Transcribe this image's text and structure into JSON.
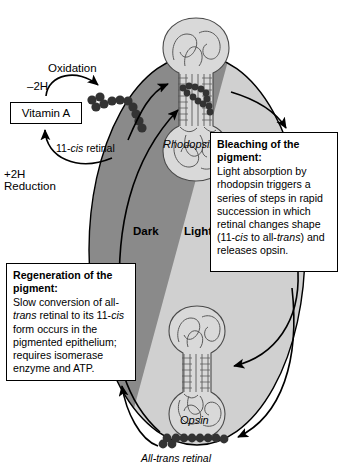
{
  "diagram": {
    "colors": {
      "dark_zone": "#8a8a8a",
      "light_zone": "#d0d0d0",
      "protein_fill": "#d9d9d9",
      "retinal": "#3a3a3a",
      "outline": "#000000",
      "callout_background": "#ffffff"
    }
  },
  "labels": {
    "oxidation": "Oxidation",
    "minus_2h": "–2H",
    "plus_2h": "+2H",
    "reduction": "Reduction",
    "vitamin_a": "Vitamin A",
    "eleven_cis_retinal_plain": "11-",
    "eleven_cis_retinal_italic": "cis",
    "eleven_cis_retinal_tail": " retinal",
    "rhodopsin": "Rhodopsin",
    "opsin": "Opsin",
    "all_trans_retinal_italic": "All-trans",
    "all_trans_retinal_tail": " retinal",
    "dark": "Dark",
    "light": "Light"
  },
  "callouts": {
    "bleaching": {
      "heading": "Bleaching of the pigment:",
      "body_part1": "Light absorption by rhodopsin triggers a series of steps in rapid succession in which retinal changes shape (11-",
      "body_italic1": "cis",
      "body_part2": " to all-",
      "body_italic2": "trans",
      "body_part3": ") and releases opsin."
    },
    "regeneration": {
      "heading": "Regeneration of the pigment:",
      "body_part1": "Slow conversion of all-",
      "body_italic1": "trans",
      "body_part2": " retinal to its 11-",
      "body_italic2": "cis",
      "body_part3": " form occurs in the pigmented epithelium; requires  isomerase enzyme and ATP."
    }
  }
}
